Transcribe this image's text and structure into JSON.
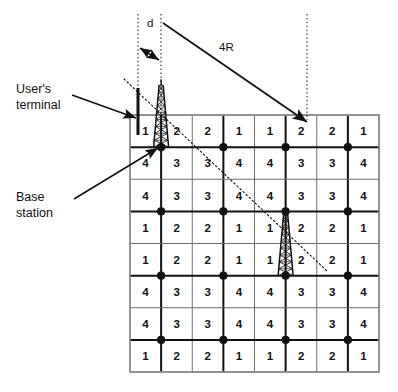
{
  "figure": {
    "kind": "cellular-frequency-reuse-diagram",
    "background": "#ffffff",
    "ink": "#111111"
  },
  "annotations": {
    "users_terminal": {
      "label_line1": "User's",
      "label_line2": "terminal",
      "x": 16,
      "y": 81,
      "leader": {
        "x1": 72,
        "y1": 95,
        "x2": 136,
        "y2": 118
      }
    },
    "base_station": {
      "label_line1": "Base",
      "label_line2": "station",
      "x": 16,
      "y": 189,
      "leader": {
        "x1": 74,
        "y1": 199,
        "x2": 158,
        "y2": 148
      }
    },
    "distance_d": {
      "label": "d",
      "label_x": 147,
      "label_y": 16,
      "guide_left_x": 138,
      "guide_right_x": 161,
      "guide_top_y": 14,
      "guide_bottom_y": 120,
      "arrow_y": 48
    },
    "reuse_distance": {
      "label": "4R",
      "label_x": 219,
      "label_y": 40,
      "arrow": {
        "x1": 163,
        "y1": 23,
        "x2": 307,
        "y2": 122
      }
    },
    "right_guide": {
      "x": 307,
      "top_y": 14,
      "bottom_y": 120
    }
  },
  "cluster_boundary": {
    "style": "dotted",
    "x1": 124,
    "y1": 79,
    "x2": 327,
    "y2": 271
  },
  "grid": {
    "left": 130,
    "top": 115,
    "right": 379,
    "bottom": 372,
    "cols": 8,
    "rows": 8,
    "cell_w": 31.125,
    "cell_h": 32.125,
    "thin_color": "#6d6d6d",
    "thick_color": "#111111",
    "border_color": "#8a8a8a",
    "cells": [
      [
        1,
        2,
        2,
        1,
        1,
        2,
        2,
        1
      ],
      [
        4,
        3,
        3,
        4,
        4,
        3,
        3,
        4
      ],
      [
        4,
        3,
        3,
        4,
        4,
        3,
        3,
        4
      ],
      [
        1,
        2,
        2,
        1,
        1,
        2,
        2,
        1
      ],
      [
        1,
        2,
        2,
        1,
        1,
        2,
        2,
        1
      ],
      [
        4,
        3,
        3,
        4,
        4,
        3,
        3,
        4
      ],
      [
        4,
        3,
        3,
        4,
        4,
        3,
        3,
        4
      ],
      [
        1,
        2,
        2,
        1,
        1,
        2,
        2,
        1
      ]
    ],
    "base_station_cols": [
      1,
      3,
      5,
      7
    ],
    "base_station_rows": [
      1,
      3,
      5,
      7
    ],
    "dot_radius": 4.1
  },
  "towers": [
    {
      "name": "tower-left",
      "col": 1,
      "row": 1,
      "height": 62,
      "half_base": 7.5
    },
    {
      "name": "tower-right",
      "col": 5,
      "row": 5,
      "height": 62,
      "half_base": 7.5
    }
  ],
  "user_terminal_antenna": {
    "x": 138,
    "y_top": 88,
    "y_bottom": 135,
    "width": 3
  }
}
